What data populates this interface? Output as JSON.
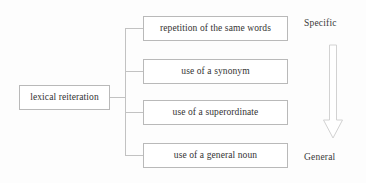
{
  "diagram": {
    "root": {
      "label": "lexical reiteration"
    },
    "leaves": [
      {
        "label": "repetition of the same words"
      },
      {
        "label": "use of a synonym"
      },
      {
        "label": "use of a superordinate"
      },
      {
        "label": "use of a general noun"
      }
    ],
    "scale": {
      "top_label": "Specific",
      "bottom_label": "General",
      "arrow_direction": "down",
      "arrow_icon": "down-arrow-outline-icon"
    },
    "colors": {
      "background": "#fdfdfd",
      "box_fill": "#ffffff",
      "box_border": "#b9b9b9",
      "connector": "#c2c2c2",
      "text": "#333333",
      "arrow_stroke": "#d2d2d2"
    }
  }
}
